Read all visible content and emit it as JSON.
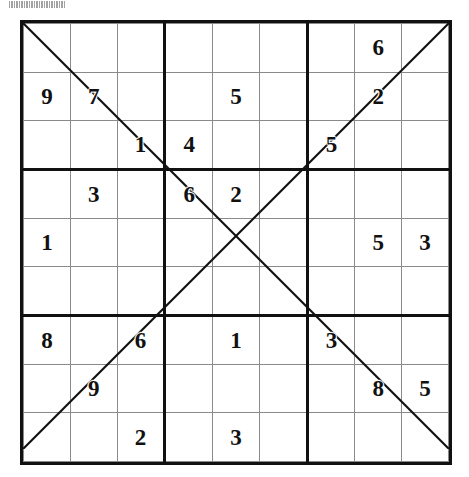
{
  "puzzle": {
    "title": "Sudoku X",
    "grid_size": 9,
    "box_size": 3,
    "diagonals": [
      "main",
      "anti"
    ],
    "line_color": "#111111",
    "digit_color": "#111111",
    "background_color": "#ffffff",
    "rows": [
      [
        "",
        "",
        "",
        "",
        "",
        "",
        "",
        "6",
        ""
      ],
      [
        "9",
        "7",
        "",
        "",
        "5",
        "",
        "",
        "2",
        ""
      ],
      [
        "",
        "",
        "1",
        "4",
        "",
        "",
        "5",
        "",
        ""
      ],
      [
        "",
        "3",
        "",
        "6",
        "2",
        "",
        "",
        "",
        ""
      ],
      [
        "1",
        "",
        "",
        "",
        "",
        "",
        "",
        "5",
        "3"
      ],
      [
        "",
        "",
        "",
        "",
        "",
        "",
        "",
        "",
        ""
      ],
      [
        "8",
        "",
        "6",
        "",
        "1",
        "",
        "3",
        "",
        ""
      ],
      [
        "",
        "9",
        "",
        "",
        "",
        "",
        "",
        "8",
        "5"
      ],
      [
        "",
        "",
        "2",
        "",
        "3",
        "",
        "",
        "",
        ""
      ]
    ]
  },
  "chart_data": {
    "type": "table",
    "categories": [
      "C1",
      "C2",
      "C3",
      "C4",
      "C5",
      "C6",
      "C7",
      "C8",
      "C9"
    ],
    "row_labels": [
      "R1",
      "R2",
      "R3",
      "R4",
      "R5",
      "R6",
      "R7",
      "R8",
      "R9"
    ],
    "values": [
      [
        "",
        "",
        "",
        "",
        "",
        "",
        "",
        "6",
        ""
      ],
      [
        "9",
        "7",
        "",
        "",
        "5",
        "",
        "",
        "2",
        ""
      ],
      [
        "",
        "",
        "1",
        "4",
        "",
        "",
        "5",
        "",
        ""
      ],
      [
        "",
        "3",
        "",
        "6",
        "2",
        "",
        "",
        "",
        ""
      ],
      [
        "1",
        "",
        "",
        "",
        "",
        "",
        "",
        "5",
        "3"
      ],
      [
        "",
        "",
        "",
        "",
        "",
        "",
        "",
        "",
        ""
      ],
      [
        "8",
        "",
        "6",
        "",
        "1",
        "",
        "3",
        "",
        ""
      ],
      [
        "",
        "9",
        "",
        "",
        "",
        "",
        "",
        "8",
        "5"
      ],
      [
        "",
        "",
        "2",
        "",
        "3",
        "",
        "",
        "",
        ""
      ]
    ],
    "given_count": 18,
    "annotations": [
      "main diagonal line top-left to bottom-right",
      "anti diagonal line bottom-left to top-right"
    ],
    "xlabel": "",
    "ylabel": "",
    "grid": true,
    "legend": "none"
  }
}
